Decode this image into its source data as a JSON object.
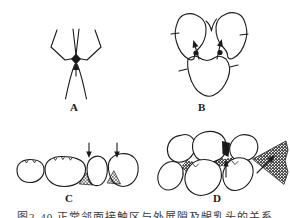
{
  "figure": {
    "background": "#ffffff",
    "ink_color": "#1b1b1b",
    "panels": [
      {
        "id": "a",
        "label": "A"
      },
      {
        "id": "b",
        "label": "B"
      },
      {
        "id": "c",
        "label": "C"
      },
      {
        "id": "d",
        "label": "D"
      }
    ],
    "caption": {
      "text": "图2-40 正常邻面接触区与外展隙及龈乳头的关系"
    }
  }
}
